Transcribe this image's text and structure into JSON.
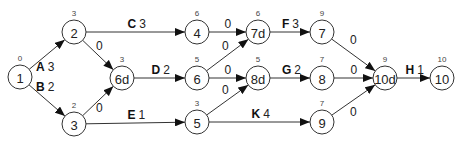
{
  "diagram": {
    "type": "activity-on-arrow network",
    "nodes": [
      {
        "id": "1",
        "label": "1",
        "time": "0",
        "x": 20,
        "y": 77
      },
      {
        "id": "2",
        "label": "2",
        "time": "3",
        "x": 74,
        "y": 32
      },
      {
        "id": "3",
        "label": "3",
        "time": "2",
        "x": 74,
        "y": 124
      },
      {
        "id": "6d",
        "label": "6d",
        "time": "3",
        "x": 122,
        "y": 78
      },
      {
        "id": "4",
        "label": "4",
        "time": "6",
        "x": 197,
        "y": 32
      },
      {
        "id": "6",
        "label": "6",
        "time": "5",
        "x": 197,
        "y": 78
      },
      {
        "id": "5",
        "label": "5",
        "time": "3",
        "x": 197,
        "y": 122
      },
      {
        "id": "7d",
        "label": "7d",
        "time": "6",
        "x": 258,
        "y": 32
      },
      {
        "id": "8d",
        "label": "8d",
        "time": "5",
        "x": 258,
        "y": 78
      },
      {
        "id": "7",
        "label": "7",
        "time": "9",
        "x": 322,
        "y": 32
      },
      {
        "id": "8",
        "label": "8",
        "time": "7",
        "x": 322,
        "y": 78
      },
      {
        "id": "9",
        "label": "9",
        "time": "7",
        "x": 322,
        "y": 122
      },
      {
        "id": "10d",
        "label": "10d",
        "time": "9",
        "x": 385,
        "y": 78
      },
      {
        "id": "10",
        "label": "10",
        "time": "10",
        "x": 442,
        "y": 78
      }
    ],
    "edges": [
      {
        "from": "1",
        "to": "2",
        "activity": "A",
        "duration": "3"
      },
      {
        "from": "1",
        "to": "3",
        "activity": "B",
        "duration": "2"
      },
      {
        "from": "2",
        "to": "4",
        "activity": "C",
        "duration": "3"
      },
      {
        "from": "2",
        "to": "6d",
        "activity": "",
        "duration": "0"
      },
      {
        "from": "3",
        "to": "6d",
        "activity": "",
        "duration": "0"
      },
      {
        "from": "6d",
        "to": "6",
        "activity": "D",
        "duration": "2"
      },
      {
        "from": "3",
        "to": "5",
        "activity": "E",
        "duration": "1"
      },
      {
        "from": "4",
        "to": "7d",
        "activity": "",
        "duration": "0"
      },
      {
        "from": "6",
        "to": "7d",
        "activity": "",
        "duration": "0"
      },
      {
        "from": "6",
        "to": "8d",
        "activity": "",
        "duration": "0"
      },
      {
        "from": "5",
        "to": "8d",
        "activity": "",
        "duration": "0"
      },
      {
        "from": "7d",
        "to": "7",
        "activity": "F",
        "duration": "3"
      },
      {
        "from": "8d",
        "to": "8",
        "activity": "G",
        "duration": "2"
      },
      {
        "from": "5",
        "to": "9",
        "activity": "K",
        "duration": "4"
      },
      {
        "from": "7",
        "to": "10d",
        "activity": "",
        "duration": "0"
      },
      {
        "from": "8",
        "to": "10d",
        "activity": "",
        "duration": "0"
      },
      {
        "from": "9",
        "to": "10d",
        "activity": "",
        "duration": "0"
      },
      {
        "from": "10d",
        "to": "10",
        "activity": "H",
        "duration": "1"
      }
    ]
  },
  "colors": {
    "stroke": "#333333",
    "background": "#ffffff",
    "text": "#222222"
  }
}
